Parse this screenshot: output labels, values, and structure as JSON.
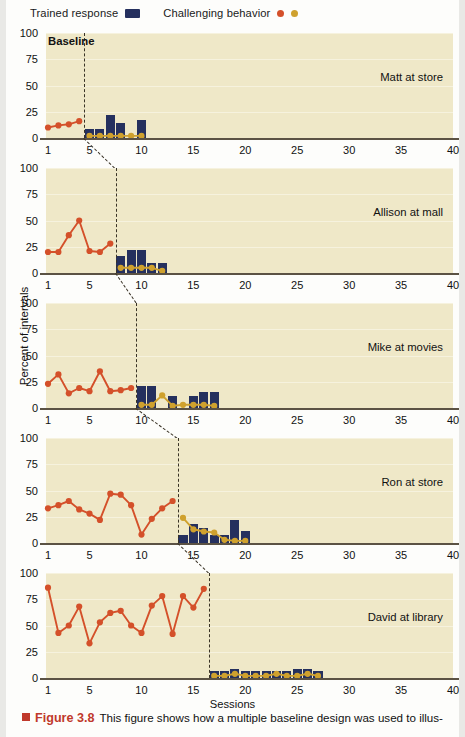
{
  "legend": {
    "trained_response_label": "Trained response",
    "challenging_behavior_label": "Challenging behavior",
    "bar_color": "#25305e",
    "dot_red_color": "#d4502a",
    "dot_gold_color": "#cfa12e"
  },
  "axes": {
    "y_title": "Percent of intervals",
    "x_title": "Sessions",
    "y_ticks": [
      "0",
      "25",
      "50",
      "75",
      "100"
    ],
    "y_min": 0,
    "y_max": 100,
    "x_ticks": [
      "1",
      "5",
      "10",
      "15",
      "20",
      "25",
      "30",
      "35",
      "40"
    ],
    "x_min": 1,
    "x_max": 40
  },
  "annotations": {
    "baseline_label": "Baseline"
  },
  "caption": {
    "figure_number": "Figure 3.8",
    "text": "This figure shows how a multiple baseline design was used to illus-"
  },
  "chart_data": {
    "type": "line",
    "title": "Figure 3.8",
    "xlabel": "Sessions",
    "ylabel": "Percent of intervals",
    "xlim": [
      1,
      40
    ],
    "ylim": [
      0,
      100
    ],
    "grid": true,
    "legend_position": "top",
    "design": "multiple baseline across participants",
    "panels": [
      {
        "name": "Matt at store",
        "phase_change_session": 4.5,
        "baseline": {
          "series_name": "Challenging behavior",
          "color": "#d4502a",
          "x": [
            1,
            2,
            3,
            4
          ],
          "y": [
            10,
            12,
            13,
            16
          ]
        },
        "intervention_challenging": {
          "series_name": "Challenging behavior",
          "color": "#cfa12e",
          "x": [
            5,
            6,
            7,
            8,
            9,
            10
          ],
          "y": [
            2,
            2,
            2,
            2,
            2,
            2
          ]
        },
        "intervention_trained": {
          "series_name": "Trained response",
          "color": "#25305e",
          "x": [
            5,
            6,
            7,
            8,
            9,
            10
          ],
          "y": [
            9,
            9,
            22,
            14,
            0,
            17
          ]
        }
      },
      {
        "name": "Allison at mall",
        "phase_change_session": 7.5,
        "baseline": {
          "series_name": "Challenging behavior",
          "color": "#d4502a",
          "x": [
            1,
            2,
            3,
            4,
            5,
            6,
            7
          ],
          "y": [
            20,
            20,
            36,
            50,
            21,
            20,
            28
          ]
        },
        "intervention_challenging": {
          "series_name": "Challenging behavior",
          "color": "#cfa12e",
          "x": [
            8,
            9,
            10,
            11,
            12
          ],
          "y": [
            5,
            5,
            5,
            5,
            2
          ]
        },
        "intervention_trained": {
          "series_name": "Trained response",
          "color": "#25305e",
          "x": [
            8,
            9,
            10,
            11,
            12
          ],
          "y": [
            16,
            22,
            22,
            10,
            10
          ]
        }
      },
      {
        "name": "Mike at movies",
        "phase_change_session": 9.5,
        "baseline": {
          "series_name": "Challenging behavior",
          "color": "#d4502a",
          "x": [
            1,
            2,
            3,
            4,
            5,
            6,
            7,
            8,
            9
          ],
          "y": [
            23,
            32,
            14,
            19,
            16,
            35,
            16,
            17,
            19
          ]
        },
        "intervention_challenging": {
          "series_name": "Challenging behavior",
          "color": "#cfa12e",
          "x": [
            10,
            11,
            12,
            13,
            14,
            15,
            16,
            17
          ],
          "y": [
            3,
            3,
            12,
            2,
            3,
            3,
            3,
            2
          ]
        },
        "intervention_trained": {
          "series_name": "Trained response",
          "color": "#25305e",
          "x": [
            10,
            11,
            12,
            13,
            14,
            15,
            16,
            17
          ],
          "y": [
            21,
            21,
            0,
            11,
            0,
            11,
            15,
            15
          ]
        }
      },
      {
        "name": "Ron at store",
        "phase_change_session": 13.5,
        "baseline": {
          "series_name": "Challenging behavior",
          "color": "#d4502a",
          "x": [
            1,
            2,
            3,
            4,
            5,
            6,
            7,
            8,
            9,
            10,
            11,
            12,
            13
          ],
          "y": [
            33,
            36,
            40,
            32,
            28,
            22,
            47,
            46,
            36,
            8,
            23,
            33,
            40
          ]
        },
        "intervention_challenging": {
          "series_name": "Challenging behavior",
          "color": "#cfa12e",
          "x": [
            14,
            15,
            16,
            17,
            18,
            19,
            20
          ],
          "y": [
            24,
            13,
            11,
            10,
            3,
            2,
            2
          ]
        },
        "intervention_trained": {
          "series_name": "Trained response",
          "color": "#25305e",
          "x": [
            14,
            15,
            16,
            17,
            18,
            19,
            20
          ],
          "y": [
            8,
            18,
            14,
            8,
            8,
            22,
            11
          ]
        }
      },
      {
        "name": "David at library",
        "phase_change_session": 16.5,
        "baseline": {
          "series_name": "Challenging behavior",
          "color": "#d4502a",
          "x": [
            1,
            2,
            3,
            4,
            5,
            6,
            7,
            8,
            9,
            10,
            11,
            12,
            13,
            14,
            15,
            16
          ],
          "y": [
            86,
            43,
            50,
            68,
            33,
            53,
            62,
            64,
            50,
            43,
            69,
            78,
            42,
            78,
            67,
            85
          ]
        },
        "intervention_challenging": {
          "series_name": "Challenging behavior",
          "color": "#cfa12e",
          "x": [
            17,
            18,
            19,
            20,
            21,
            22,
            23,
            24,
            25,
            26,
            27
          ],
          "y": [
            2,
            2,
            4,
            2,
            2,
            2,
            4,
            2,
            2,
            4,
            2
          ]
        },
        "intervention_trained": {
          "series_name": "Trained response",
          "color": "#25305e",
          "x": [
            17,
            18,
            19,
            20,
            21,
            22,
            23,
            24,
            25,
            26,
            27
          ],
          "y": [
            7,
            7,
            9,
            7,
            7,
            7,
            7,
            7,
            9,
            9,
            7
          ]
        }
      }
    ]
  }
}
